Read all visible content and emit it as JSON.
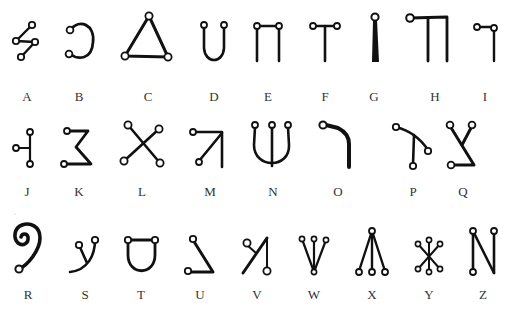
{
  "stroke_color": "#111111",
  "letters": [
    {
      "letter": "A",
      "x": 27,
      "y": 90
    },
    {
      "letter": "B",
      "x": 79,
      "y": 90
    },
    {
      "letter": "C",
      "x": 148,
      "y": 90
    },
    {
      "letter": "D",
      "x": 214,
      "y": 90
    },
    {
      "letter": "E",
      "x": 268,
      "y": 90
    },
    {
      "letter": "F",
      "x": 325,
      "y": 90
    },
    {
      "letter": "G",
      "x": 374,
      "y": 90
    },
    {
      "letter": "H",
      "x": 435,
      "y": 90
    },
    {
      "letter": "I",
      "x": 485,
      "y": 90
    },
    {
      "letter": "J",
      "x": 27,
      "y": 185
    },
    {
      "letter": "K",
      "x": 79,
      "y": 185
    },
    {
      "letter": "L",
      "x": 142,
      "y": 185
    },
    {
      "letter": "M",
      "x": 210,
      "y": 185
    },
    {
      "letter": "N",
      "x": 273,
      "y": 185
    },
    {
      "letter": "O",
      "x": 338,
      "y": 185
    },
    {
      "letter": "P",
      "x": 413,
      "y": 185
    },
    {
      "letter": "Q",
      "x": 463,
      "y": 185
    },
    {
      "letter": "R",
      "x": 28,
      "y": 288
    },
    {
      "letter": "S",
      "x": 85,
      "y": 288
    },
    {
      "letter": "T",
      "x": 141,
      "y": 288
    },
    {
      "letter": "U",
      "x": 200,
      "y": 288
    },
    {
      "letter": "V",
      "x": 257,
      "y": 288
    },
    {
      "letter": "W",
      "x": 314,
      "y": 288
    },
    {
      "letter": "X",
      "x": 372,
      "y": 288
    },
    {
      "letter": "Y",
      "x": 429,
      "y": 288
    },
    {
      "letter": "Z",
      "x": 483,
      "y": 288
    }
  ]
}
